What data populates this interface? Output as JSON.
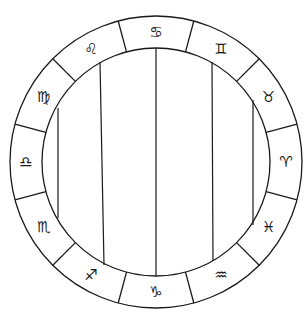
{
  "wheel": {
    "center": [
      156,
      162
    ],
    "outer_radius": 146,
    "inner_radius": 114,
    "stroke_color": "#1a1a1a",
    "background": "#ffffff",
    "signs": [
      {
        "name": "aries",
        "glyph": "♈︎",
        "angle_deg": 0
      },
      {
        "name": "taurus",
        "glyph": "♉︎",
        "angle_deg": 30
      },
      {
        "name": "gemini",
        "glyph": "♊︎",
        "angle_deg": 60
      },
      {
        "name": "cancer",
        "glyph": "♋︎",
        "angle_deg": 90
      },
      {
        "name": "leo",
        "glyph": "♌︎",
        "angle_deg": 120
      },
      {
        "name": "virgo",
        "glyph": "♍︎",
        "angle_deg": 150
      },
      {
        "name": "libra",
        "glyph": "♎︎",
        "angle_deg": 180
      },
      {
        "name": "scorpio",
        "glyph": "♏︎",
        "angle_deg": 210
      },
      {
        "name": "sagittarius",
        "glyph": "♐︎",
        "angle_deg": 240
      },
      {
        "name": "capricorn",
        "glyph": "♑︎",
        "angle_deg": 270
      },
      {
        "name": "aquarius",
        "glyph": "♒︎",
        "angle_deg": 300
      },
      {
        "name": "pisces",
        "glyph": "♓︎",
        "angle_deg": 330
      }
    ],
    "vertical_lines": [
      {
        "x1": 58,
        "y1": 108,
        "x2": 58,
        "y2": 218
      },
      {
        "x1": 100,
        "y1": 62,
        "x2": 104,
        "y2": 265
      },
      {
        "x1": 156,
        "y1": 48,
        "x2": 156,
        "y2": 276
      },
      {
        "x1": 212,
        "y1": 62,
        "x2": 213,
        "y2": 261
      },
      {
        "x1": 253,
        "y1": 100,
        "x2": 253,
        "y2": 225
      }
    ]
  }
}
